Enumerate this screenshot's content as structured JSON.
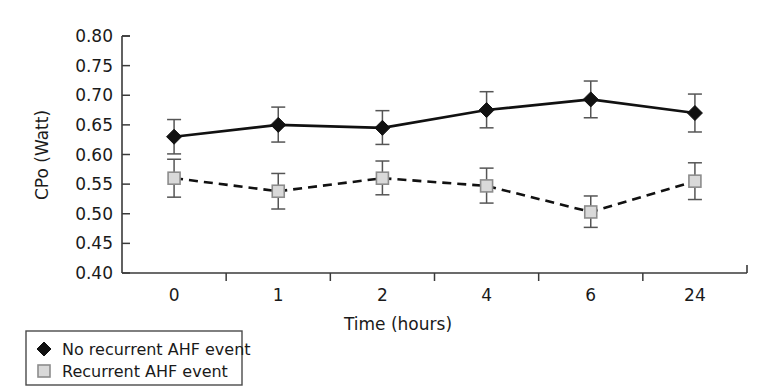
{
  "chart_data": {
    "type": "line",
    "title": "",
    "xlabel": "Time (hours)",
    "ylabel": "CPo (Watt)",
    "categories": [
      "0",
      "1",
      "2",
      "4",
      "6",
      "24"
    ],
    "x_tick_labels": [
      "0",
      "1",
      "2",
      "4",
      "6",
      "24"
    ],
    "y_tick_labels": [
      "0.80",
      "0.75",
      "0.70",
      "0.65",
      "0.60",
      "0.55",
      "0.50",
      "0.45",
      "0.40"
    ],
    "y_tick_values": [
      0.8,
      0.75,
      0.7,
      0.65,
      0.6,
      0.55,
      0.5,
      0.45,
      0.4
    ],
    "ylim": [
      0.4,
      0.8
    ],
    "grid": false,
    "legend_position": "below-left",
    "series": [
      {
        "name": "No recurrent AHF event",
        "marker": "filled-diamond",
        "line_style": "solid",
        "color": "#111111",
        "values": [
          0.63,
          0.65,
          0.645,
          0.675,
          0.693,
          0.67
        ],
        "error_low": [
          0.601,
          0.621,
          0.617,
          0.645,
          0.662,
          0.638
        ],
        "error_high": [
          0.659,
          0.68,
          0.674,
          0.706,
          0.724,
          0.702
        ]
      },
      {
        "name": "Recurrent AHF event",
        "marker": "open-square",
        "line_style": "dashed",
        "color": "#d9d9d9",
        "values": [
          0.56,
          0.538,
          0.56,
          0.547,
          0.503,
          0.555
        ],
        "error_low": [
          0.528,
          0.508,
          0.532,
          0.518,
          0.477,
          0.524
        ],
        "error_high": [
          0.592,
          0.568,
          0.589,
          0.577,
          0.53,
          0.586
        ]
      }
    ],
    "legend": [
      {
        "label": "No recurrent AHF event",
        "marker": "filled-diamond",
        "color": "#111111"
      },
      {
        "label": "Recurrent AHF event",
        "marker": "open-square",
        "color": "#d9d9d9"
      }
    ]
  }
}
